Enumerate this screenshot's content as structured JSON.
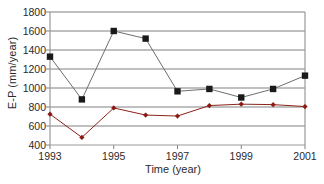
{
  "chart_data": {
    "type": "line",
    "title": "",
    "xlabel": "Time (year)",
    "ylabel": "E-P (mm/year)",
    "x": [
      1993,
      1994,
      1995,
      1996,
      1997,
      1998,
      1999,
      2000,
      2001
    ],
    "xlim": [
      1993,
      2001
    ],
    "ylim": [
      400,
      1800
    ],
    "yticks": [
      400,
      600,
      800,
      1000,
      1200,
      1400,
      1600,
      1800
    ],
    "xticks": [
      1993,
      1995,
      1997,
      1999,
      2001
    ],
    "xtick_labels": [
      "1993",
      "1995",
      "1997",
      "1999",
      "2001"
    ],
    "ytick_labels": [
      "400",
      "600",
      "800",
      "1000",
      "1200",
      "1400",
      "1600",
      "1800"
    ],
    "grid": "horizontal",
    "legend": "none",
    "series": [
      {
        "name": "black-series",
        "color": "#1a1a1a",
        "marker": "square",
        "line_color": "#6e6e6e",
        "values": [
          1330,
          880,
          1600,
          1520,
          965,
          990,
          900,
          990,
          1130
        ]
      },
      {
        "name": "red-series",
        "color": "#8c1a13",
        "marker": "diamond",
        "line_color": "#8c2318",
        "values": [
          725,
          480,
          790,
          715,
          705,
          815,
          830,
          825,
          805
        ]
      }
    ]
  },
  "axes": {
    "frame_color": "#999999",
    "gridline_color": "#808080",
    "tick_color": "#808080",
    "text_color": "#2b2b2b"
  }
}
